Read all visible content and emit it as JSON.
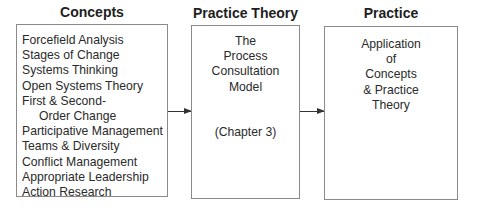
{
  "columns": [
    {
      "title": "Concepts",
      "items": [
        {
          "text": "Forcefield Analysis",
          "indent": false
        },
        {
          "text": "Stages of Change",
          "indent": false
        },
        {
          "text": "Systems Thinking",
          "indent": false
        },
        {
          "text": "Open Systems Theory",
          "indent": false
        },
        {
          "text": "First & Second-",
          "indent": false
        },
        {
          "text": "Order Change",
          "indent": true
        },
        {
          "text": "Participative Management",
          "indent": false
        },
        {
          "text": "Teams & Diversity",
          "indent": false
        },
        {
          "text": "Conflict Management",
          "indent": false
        },
        {
          "text": "Appropriate Leadership",
          "indent": false
        },
        {
          "text": "Action Research",
          "indent": false
        }
      ]
    },
    {
      "title": "Practice Theory",
      "lines": [
        "The",
        "Process",
        "Consultation",
        "Model"
      ],
      "note": "(Chapter 3)"
    },
    {
      "title": "Practice",
      "lines": [
        "Application",
        "of",
        "Concepts",
        "& Practice",
        "Theory"
      ]
    }
  ],
  "arrows": [
    {
      "from": "Concepts",
      "to": "Practice Theory"
    },
    {
      "from": "Practice Theory",
      "to": "Practice"
    }
  ]
}
